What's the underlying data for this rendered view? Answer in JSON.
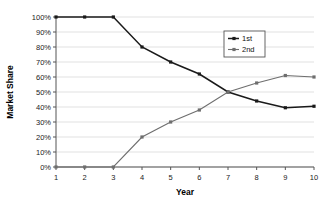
{
  "chart_data": {
    "type": "line",
    "title": "",
    "xlabel": "Year",
    "ylabel": "Market Share",
    "x": [
      1,
      2,
      3,
      4,
      5,
      6,
      7,
      8,
      9,
      10
    ],
    "xticklabels": [
      "1",
      "2",
      "3",
      "4",
      "5",
      "6",
      "7",
      "8",
      "9",
      "10"
    ],
    "yticklabels": [
      "0%",
      "10%",
      "20%",
      "30%",
      "40%",
      "50%",
      "60%",
      "70%",
      "80%",
      "90%",
      "100%"
    ],
    "ytickvalues": [
      0,
      10,
      20,
      30,
      40,
      50,
      60,
      70,
      80,
      90,
      100
    ],
    "xlim": [
      1,
      10
    ],
    "ylim": [
      0,
      100
    ],
    "grid": "horizontal",
    "legend_position": "upper-right-inside",
    "series": [
      {
        "name": "1st",
        "color": "#1a1a1a",
        "marker": "square",
        "values": [
          100,
          100,
          100,
          80,
          70,
          62,
          50,
          44,
          39.5,
          40.5
        ]
      },
      {
        "name": "2nd",
        "color": "#6e6e6e",
        "marker": "square",
        "values": [
          0,
          0,
          0,
          20,
          30,
          38,
          50,
          56,
          61,
          60
        ]
      }
    ]
  },
  "legend": {
    "entries": [
      {
        "label": "1st"
      },
      {
        "label": "2nd"
      }
    ]
  },
  "axes": {
    "x_title": "Year",
    "y_title": "Market Share"
  },
  "colors": {
    "series_1": "#1a1a1a",
    "series_2": "#6e6e6e",
    "gridline": "#d9d9d9",
    "axis": "#555555",
    "background": "#ffffff"
  }
}
